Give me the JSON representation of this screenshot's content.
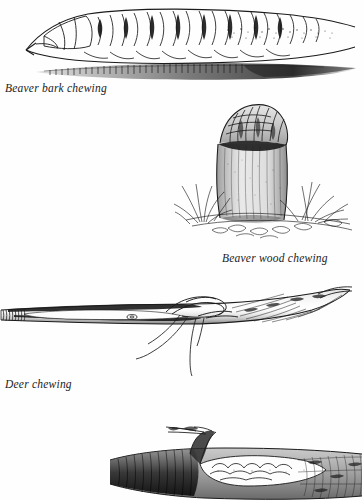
{
  "plate": {
    "kind": "natural-history-illustration-plate",
    "medium": "pen-and-ink line drawings",
    "background_color": "#fefefe",
    "ink_color": "#1b1b1b",
    "width": 364,
    "height": 500
  },
  "figures": [
    {
      "id": "beaver-bark-chewing",
      "caption": "Beaver bark chewing",
      "subject": "debarked log with beaver incisor gouge marks and cast shadow",
      "caption_align": "left",
      "order": 1
    },
    {
      "id": "beaver-wood-chewing",
      "caption": "Beaver wood chewing",
      "subject": "gnawed tree stump with pointed chewed crown, surrounded by grass and ground litter",
      "caption_align": "right",
      "order": 2
    },
    {
      "id": "deer-chewing",
      "caption": "Deer chewing",
      "subject": "twig with ragged torn break and hanging fibre strands",
      "caption_align": "left",
      "order": 3
    },
    {
      "id": "unlabeled-branch-chewing",
      "caption": "",
      "subject": "branch with stub twig and pale chewed blaze, cropped at page edge",
      "caption_align": "none",
      "order": 4
    }
  ]
}
